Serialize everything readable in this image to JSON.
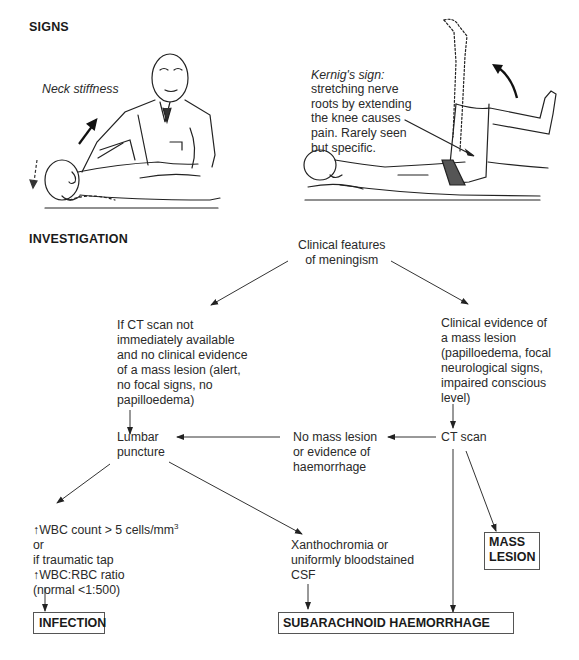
{
  "signs": {
    "heading": "SIGNS",
    "neck_stiffness_label": "Neck stiffness",
    "kernig": {
      "title": "Kernig's sign:",
      "description": "stretching nerve\nroots by extending\nthe knee causes\npain. Rarely seen\nbut specific."
    }
  },
  "investigation": {
    "heading": "INVESTIGATION",
    "nodes": {
      "clinical_features": "Clinical features\nof meningism",
      "no_ct": "If CT scan not\nimmediately available\nand no clinical evidence\nof a mass lesion (alert,\nno focal signs, no\npapilloedema)",
      "mass_evidence": "Clinical evidence of\na mass lesion\n(papilloedema, focal\nneurological signs,\nimpaired conscious\nlevel)",
      "lumbar_puncture": "Lumbar\npuncture",
      "no_mass": "No mass lesion\nor evidence of\nhaemorrhage",
      "ct_scan": "CT scan",
      "wbc_line1": "↑WBC count > 5 cells/mm",
      "wbc_sup": "3",
      "wbc_rest": "or\nif traumatic tap\n↑WBC:RBC ratio\n(normal <1:500)",
      "xanthochromia": "Xanthochromia or\nuniformly bloodstained\nCSF"
    },
    "outcomes": {
      "infection": "INFECTION",
      "mass_lesion": "MASS\nLESION",
      "sah": "SUBARACHNOID HAEMORRHAGE"
    }
  },
  "colors": {
    "line": "#333333",
    "text": "#2a2a2a",
    "box_border": "#555555"
  }
}
